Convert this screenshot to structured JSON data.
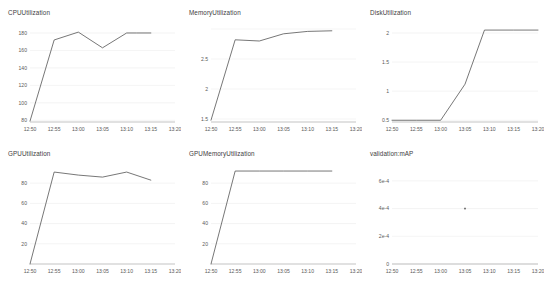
{
  "dashboard": {
    "title": "Training job metrics dashboard",
    "background_color": "#ffffff",
    "line_color": "#4a4a4a",
    "grid_color": "#e9e9e9",
    "axis_color": "#9a9a9a",
    "text_color": "#3d3d3d"
  },
  "chart_data": [
    {
      "id": "cpu-utilization",
      "type": "line",
      "title": "CPUUtilization",
      "xlabel": "",
      "ylabel": "",
      "grid": true,
      "legend": false,
      "x": [
        "12:50",
        "12:52",
        "12:55",
        "13:00",
        "13:05",
        "13:10",
        "13:12",
        "13:15"
      ],
      "xtick_labels": [
        "12:50",
        "12:55",
        "13:00",
        "13:05",
        "13:10",
        "13:15",
        "13:20"
      ],
      "ytick_labels": [
        "80",
        "100",
        "120",
        "140",
        "160",
        "180"
      ],
      "ylim": [
        78,
        188
      ],
      "xlim_minutes": [
        770,
        800
      ],
      "series": [
        {
          "name": "CPUUtilization",
          "x_minutes": [
            770,
            775,
            780,
            785,
            790,
            792,
            795
          ],
          "values": [
            79,
            172,
            181,
            163,
            180,
            180,
            180
          ]
        }
      ]
    },
    {
      "id": "memory-utilization",
      "type": "line",
      "title": "MemoryUtilization",
      "xlabel": "",
      "ylabel": "",
      "grid": true,
      "legend": false,
      "xtick_labels": [
        "12:50",
        "12:55",
        "13:00",
        "13:05",
        "13:10",
        "13:15",
        "13:20"
      ],
      "ytick_labels": [
        "1.5",
        "2",
        "2.5"
      ],
      "ylim": [
        1.45,
        3.05
      ],
      "xlim_minutes": [
        770,
        800
      ],
      "series": [
        {
          "name": "MemoryUtilization",
          "x_minutes": [
            770,
            775,
            780,
            785,
            790,
            795
          ],
          "values": [
            1.48,
            2.82,
            2.8,
            2.92,
            2.96,
            2.97
          ]
        }
      ]
    },
    {
      "id": "disk-utilization",
      "type": "line",
      "title": "DiskUtilization",
      "xlabel": "",
      "ylabel": "",
      "grid": true,
      "legend": false,
      "xtick_labels": [
        "12:50",
        "12:55",
        "13:00",
        "13:05",
        "13:10",
        "13:15",
        "13:20"
      ],
      "ytick_labels": [
        "0.5",
        "1",
        "1.5",
        "2"
      ],
      "ylim": [
        0.47,
        2.12
      ],
      "xlim_minutes": [
        770,
        800
      ],
      "series": [
        {
          "name": "DiskUtilization",
          "x_minutes": [
            770,
            775,
            780,
            785,
            789,
            795,
            800
          ],
          "values": [
            0.5,
            0.5,
            0.5,
            1.12,
            2.05,
            2.05,
            2.05
          ]
        }
      ]
    },
    {
      "id": "gpu-utilization",
      "type": "line",
      "title": "GPUUtilization",
      "xlabel": "",
      "ylabel": "",
      "grid": true,
      "legend": false,
      "xtick_labels": [
        "12:50",
        "12:55",
        "13:00",
        "13:05",
        "13:10",
        "13:15",
        "13:20"
      ],
      "ytick_labels": [
        "20",
        "40",
        "60",
        "80"
      ],
      "ylim": [
        0,
        96
      ],
      "xlim_minutes": [
        770,
        800
      ],
      "series": [
        {
          "name": "GPUUtilization",
          "x_minutes": [
            770,
            775,
            780,
            785,
            790,
            795
          ],
          "values": [
            0,
            91,
            88,
            86,
            91,
            83
          ]
        }
      ]
    },
    {
      "id": "gpu-memory-utilization",
      "type": "line",
      "title": "GPUMemoryUtilization",
      "xlabel": "",
      "ylabel": "",
      "grid": true,
      "legend": false,
      "xtick_labels": [
        "12:50",
        "12:55",
        "13:00",
        "13:05",
        "13:10",
        "13:15",
        "13:20"
      ],
      "ytick_labels": [
        "20",
        "40",
        "60",
        "80"
      ],
      "ylim": [
        0,
        96
      ],
      "xlim_minutes": [
        770,
        800
      ],
      "series": [
        {
          "name": "GPUMemoryUtilization",
          "x_minutes": [
            770,
            775,
            780,
            785,
            790,
            795
          ],
          "values": [
            0,
            92,
            92,
            92,
            92,
            92
          ]
        }
      ]
    },
    {
      "id": "validation-map",
      "type": "scatter",
      "title": "validation:mAP",
      "xlabel": "",
      "ylabel": "",
      "grid": true,
      "legend": false,
      "xtick_labels": [
        "12:50",
        "12:55",
        "13:00",
        "13:05",
        "13:10",
        "13:15",
        "13:20"
      ],
      "ytick_labels": [
        "0",
        "2e-4",
        "4e-4",
        "6e-4"
      ],
      "ylim": [
        0,
        0.0007
      ],
      "xlim_minutes": [
        770,
        800
      ],
      "series": [
        {
          "name": "validation:mAP",
          "x_minutes": [
            785
          ],
          "values": [
            0.0004
          ]
        }
      ]
    }
  ]
}
